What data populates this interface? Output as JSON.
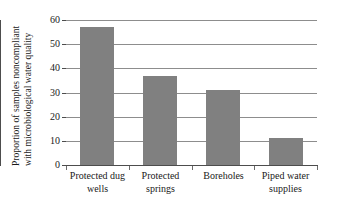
{
  "chart_data": {
    "type": "bar",
    "title": "",
    "subtitle": "",
    "xlabel": "",
    "ylabel_line1": "Proportion of samples noncompliant",
    "ylabel_line2": "with microbiological water quality",
    "categories": [
      "Protected dug wells",
      "Protected springs",
      "Boreholes",
      "Piped water supplies"
    ],
    "category_lines": [
      [
        "Protected dug",
        "wells"
      ],
      [
        "Protected",
        "springs"
      ],
      [
        "Boreholes",
        ""
      ],
      [
        "Piped water",
        "supplies"
      ]
    ],
    "values": [
      57,
      37,
      31,
      11
    ],
    "ylim": [
      0,
      60
    ],
    "yticks": [
      0,
      10,
      20,
      30,
      40,
      50,
      60
    ],
    "ytick_labels": [
      "0",
      "10",
      "20",
      "30",
      "40",
      "50",
      "60"
    ],
    "grid": true,
    "grid_axis": "y",
    "legend": false,
    "legend_position": "none",
    "bar_color": "#808080",
    "axis_color": "#4d4d4d",
    "grid_color": "#8d8d8d",
    "background": "#ffffff"
  }
}
